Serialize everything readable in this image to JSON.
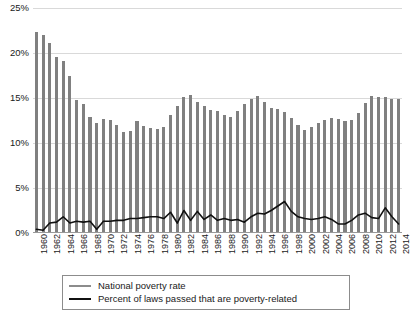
{
  "chart_data": {
    "type": "bar",
    "title": "",
    "subtitle": "",
    "xlabel": "",
    "ylabel": "",
    "ylim": [
      0,
      25
    ],
    "ytick_labels": [
      "0%",
      "5%",
      "10%",
      "15%",
      "20%",
      "25%"
    ],
    "ytick_values": [
      0,
      5,
      10,
      15,
      20,
      25
    ],
    "grid": true,
    "legend_position": "bottom",
    "x": [
      1960,
      1961,
      1962,
      1963,
      1964,
      1965,
      1966,
      1967,
      1968,
      1969,
      1970,
      1971,
      1972,
      1973,
      1974,
      1975,
      1976,
      1977,
      1978,
      1979,
      1980,
      1981,
      1982,
      1983,
      1984,
      1985,
      1986,
      1987,
      1988,
      1989,
      1990,
      1991,
      1992,
      1993,
      1994,
      1995,
      1996,
      1997,
      1998,
      1999,
      2000,
      2001,
      2002,
      2003,
      2004,
      2005,
      2006,
      2007,
      2008,
      2009,
      2010,
      2011,
      2012,
      2013,
      2014
    ],
    "xtick_labels": [
      "1960",
      "1962",
      "1964",
      "1966",
      "1968",
      "1970",
      "1972",
      "1974",
      "1976",
      "1978",
      "1980",
      "1982",
      "1984",
      "1986",
      "1988",
      "1990",
      "1992",
      "1994",
      "1996",
      "1998",
      "2000",
      "2002",
      "2004",
      "2006",
      "2008",
      "2010",
      "2012",
      "2014"
    ],
    "series": [
      {
        "name": "National poverty rate",
        "render": "bar",
        "color": "#808080",
        "values": [
          22.2,
          21.9,
          21.0,
          19.5,
          19.0,
          17.3,
          14.7,
          14.2,
          12.8,
          12.1,
          12.6,
          12.5,
          11.9,
          11.1,
          11.2,
          12.3,
          11.8,
          11.6,
          11.4,
          11.7,
          13.0,
          14.0,
          15.0,
          15.2,
          14.4,
          14.0,
          13.6,
          13.4,
          13.0,
          12.8,
          13.5,
          14.2,
          14.8,
          15.1,
          14.5,
          13.8,
          13.7,
          13.3,
          12.7,
          11.9,
          11.3,
          11.7,
          12.1,
          12.5,
          12.7,
          12.6,
          12.3,
          12.5,
          13.2,
          14.3,
          15.1,
          15.0,
          15.0,
          14.8,
          14.8
        ]
      },
      {
        "name": "Percent of laws passed that are poverty-related",
        "render": "line",
        "color": "#111111",
        "values": [
          0.3,
          0.2,
          1.0,
          1.1,
          1.7,
          1.0,
          1.2,
          1.1,
          1.2,
          0.3,
          1.2,
          1.2,
          1.3,
          1.3,
          1.5,
          1.5,
          1.6,
          1.7,
          1.7,
          1.5,
          2.2,
          1.0,
          2.4,
          1.3,
          2.3,
          1.4,
          1.9,
          1.3,
          1.5,
          1.3,
          1.4,
          1.1,
          1.7,
          2.1,
          2.0,
          2.4,
          2.9,
          3.4,
          2.3,
          1.7,
          1.5,
          1.4,
          1.5,
          1.7,
          1.4,
          0.9,
          0.9,
          1.3,
          1.9,
          2.1,
          1.6,
          1.5,
          2.7,
          1.7,
          0.9
        ]
      }
    ]
  },
  "legend": {
    "items": [
      {
        "label": "National poverty rate",
        "style": "gray"
      },
      {
        "label": "Percent of laws passed that are poverty-related",
        "style": "black"
      }
    ]
  }
}
